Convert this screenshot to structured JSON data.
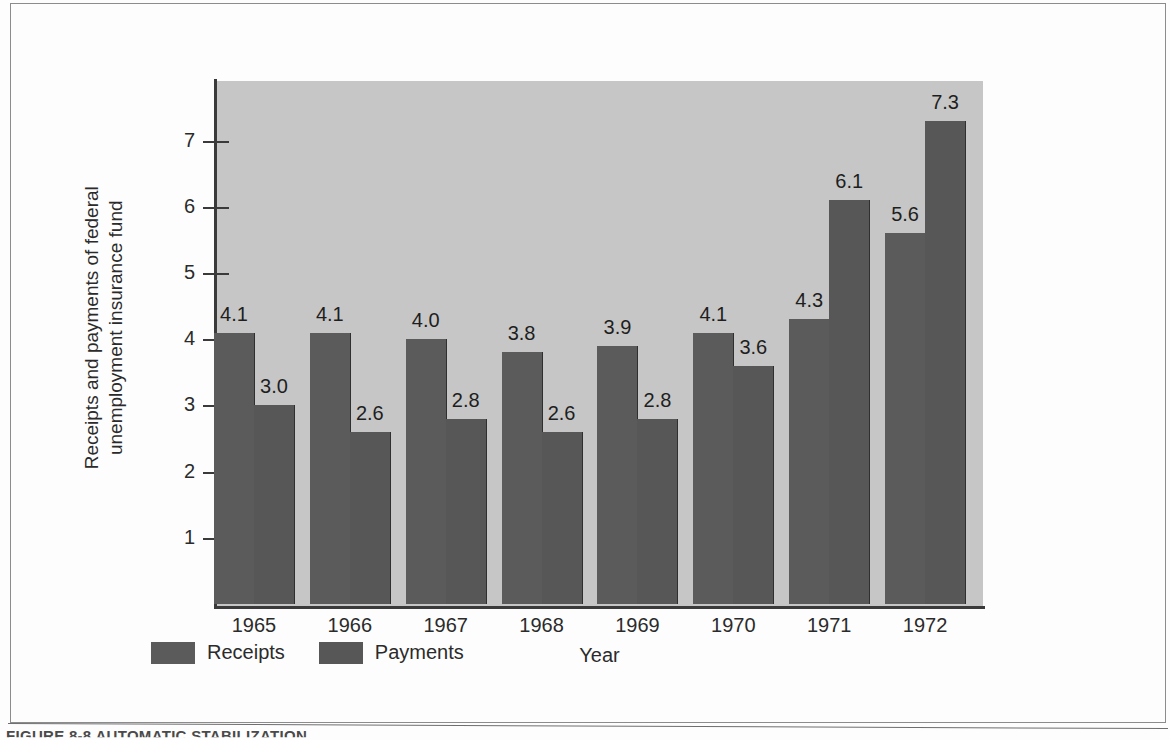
{
  "figure": {
    "caption": "FIGURE 8-8    AUTOMATIC STABILIZATION"
  },
  "legend": {
    "items": [
      {
        "label": "Receipts",
        "color": "#5b5b5b"
      },
      {
        "label": "Payments",
        "color": "#575757"
      }
    ]
  },
  "colors": {
    "plot_background": "#c6c6c6",
    "page_background": "#fdfdfd",
    "bar_receipts": "#5b5b5b",
    "bar_payments": "#575757",
    "axis": "#3a3a3a",
    "text": "#2b2b2b"
  },
  "chart_data": {
    "type": "bar",
    "title": "",
    "xlabel": "Year",
    "ylabel": "Receipts and payments of federal\nunemployment insurance fund",
    "categories": [
      "1965",
      "1966",
      "1967",
      "1968",
      "1969",
      "1970",
      "1971",
      "1972"
    ],
    "series": [
      {
        "name": "Receipts",
        "values": [
          4.1,
          4.1,
          4.0,
          3.8,
          3.9,
          4.1,
          4.3,
          5.6
        ]
      },
      {
        "name": "Payments",
        "values": [
          3.0,
          2.6,
          2.8,
          2.6,
          2.8,
          3.6,
          6.1,
          7.3
        ]
      }
    ],
    "value_labels": [
      [
        "4.1",
        "3.0"
      ],
      [
        "4.1",
        "2.6"
      ],
      [
        "4.0",
        "2.8"
      ],
      [
        "3.8",
        "2.6"
      ],
      [
        "3.9",
        "2.8"
      ],
      [
        "4.1",
        "3.6"
      ],
      [
        "4.3",
        "6.1"
      ],
      [
        "5.6",
        "7.3"
      ]
    ],
    "yticks": [
      1,
      2,
      3,
      4,
      5,
      6,
      7
    ],
    "ytick_labels": [
      "1",
      "2",
      "3",
      "4",
      "5",
      "6",
      "7"
    ],
    "ylim": [
      0,
      7.95
    ],
    "grid": false,
    "legend_position": "below-axis-left"
  }
}
